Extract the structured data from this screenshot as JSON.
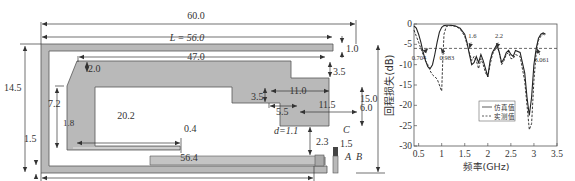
{
  "diagram": {
    "dimensions": {
      "total_width": "60.0",
      "length_L": "L = 56.0",
      "top_gap": "1.0",
      "inner_top_length": "47.0",
      "chamfer_width": "2.0",
      "step_height_1": "3.5",
      "step_width_1": "11.0",
      "step_height_2": "3.5",
      "total_height_right": "15.0",
      "left_height": "14.5",
      "inner_left_height": "7.2",
      "step_width_2": "5.5",
      "step_width_3": "11.5",
      "step_height_3": "6.0",
      "inner_strip_length": "20.2",
      "inner_strip_offset": "1.8",
      "inner_strip_thickness": "0.4",
      "gap_d": "d=1.1",
      "feed_width": "2.3",
      "bottom_strip_height": "1.5",
      "bottom_strip_height_right": "1.5",
      "bottom_length": "56.4",
      "point_A": "A",
      "point_B": "B",
      "point_C": "C"
    },
    "colors": {
      "strip_fill": "#b9b9b9",
      "strip_stroke": "#555555",
      "feed_fill": "#444444"
    }
  },
  "chart_data": {
    "type": "line",
    "title": "",
    "xlabel": "频率(GHz)",
    "ylabel": "回程损失(dB)",
    "xlim": [
      0.4,
      3.5
    ],
    "ylim": [
      -30,
      0
    ],
    "xticks": [
      "0.5",
      "1",
      "1.5",
      "2",
      "2.5",
      "3",
      "3.5"
    ],
    "yticks": [
      "0",
      "-5",
      "-10",
      "-15",
      "-20",
      "-25",
      "-30"
    ],
    "threshold_db": -6,
    "legend": {
      "position": "center-right",
      "entries": [
        "仿真值",
        "实测值"
      ]
    },
    "annotations": [
      {
        "text": "0.704",
        "x": 0.704,
        "y": -6
      },
      {
        "text": "0.983",
        "x": 0.983,
        "y": -6
      },
      {
        "text": "1.6",
        "x": 1.6,
        "y": -6
      },
      {
        "text": "2.2",
        "x": 2.2,
        "y": -6
      },
      {
        "text": "3.061",
        "x": 3.061,
        "y": -6
      }
    ],
    "series": [
      {
        "name": "仿真值",
        "style": "solid",
        "x": [
          0.4,
          0.45,
          0.5,
          0.55,
          0.6,
          0.65,
          0.7,
          0.75,
          0.8,
          0.85,
          0.9,
          0.95,
          1.0,
          1.05,
          1.1,
          1.2,
          1.3,
          1.4,
          1.5,
          1.55,
          1.6,
          1.65,
          1.7,
          1.75,
          1.8,
          1.85,
          1.9,
          1.95,
          2.0,
          2.05,
          2.1,
          2.15,
          2.2,
          2.25,
          2.3,
          2.35,
          2.4,
          2.45,
          2.5,
          2.55,
          2.6,
          2.7,
          2.8,
          2.85,
          2.9,
          2.95,
          3.0,
          3.05,
          3.1,
          3.15,
          3.2,
          3.25
        ],
        "y": [
          -0.5,
          -1.0,
          -2.5,
          -4.5,
          -7.0,
          -9.0,
          -10.5,
          -11.0,
          -10.0,
          -7.5,
          -4.5,
          -2.0,
          -0.8,
          -0.4,
          -0.3,
          -0.3,
          -0.5,
          -1.0,
          -2.5,
          -4.5,
          -7.5,
          -10.0,
          -9.5,
          -8.0,
          -9.5,
          -7.5,
          -9.0,
          -11.0,
          -13.0,
          -9.0,
          -7.0,
          -6.0,
          -5.0,
          -7.0,
          -9.5,
          -8.5,
          -7.0,
          -6.5,
          -7.5,
          -8.0,
          -6.5,
          -7.0,
          -12.0,
          -18.0,
          -22.5,
          -18.0,
          -10.0,
          -6.0,
          -3.5,
          -2.5,
          -2.2,
          -2.5
        ]
      },
      {
        "name": "实测值",
        "style": "dashed",
        "x": [
          0.4,
          0.45,
          0.5,
          0.55,
          0.6,
          0.65,
          0.7,
          0.75,
          0.8,
          0.85,
          0.9,
          0.95,
          0.98,
          1.0,
          1.02,
          1.05,
          1.1,
          1.2,
          1.3,
          1.4,
          1.5,
          1.55,
          1.6,
          1.65,
          1.7,
          1.75,
          1.8,
          1.85,
          1.9,
          1.95,
          2.0,
          2.05,
          2.1,
          2.15,
          2.2,
          2.25,
          2.3,
          2.35,
          2.4,
          2.45,
          2.5,
          2.55,
          2.6,
          2.7,
          2.8,
          2.85,
          2.9,
          2.95,
          3.0,
          3.05,
          3.1,
          3.15,
          3.2,
          3.25
        ],
        "y": [
          -1.5,
          -3.0,
          -4.5,
          -6.0,
          -7.5,
          -9.0,
          -10.0,
          -11.5,
          -12.5,
          -13.0,
          -13.5,
          -15.0,
          -16.0,
          -16.5,
          -10.0,
          -2.5,
          -0.6,
          -0.4,
          -0.6,
          -1.2,
          -3.0,
          -5.0,
          -7.0,
          -9.0,
          -8.0,
          -9.0,
          -11.0,
          -8.5,
          -10.0,
          -12.0,
          -13.0,
          -10.0,
          -7.5,
          -6.5,
          -5.5,
          -7.0,
          -10.0,
          -9.0,
          -7.5,
          -7.0,
          -8.5,
          -8.5,
          -7.5,
          -8.0,
          -14.0,
          -20.0,
          -26.0,
          -24.5,
          -14.0,
          -7.0,
          -4.0,
          -3.0,
          -2.5,
          -2.8
        ]
      }
    ]
  }
}
